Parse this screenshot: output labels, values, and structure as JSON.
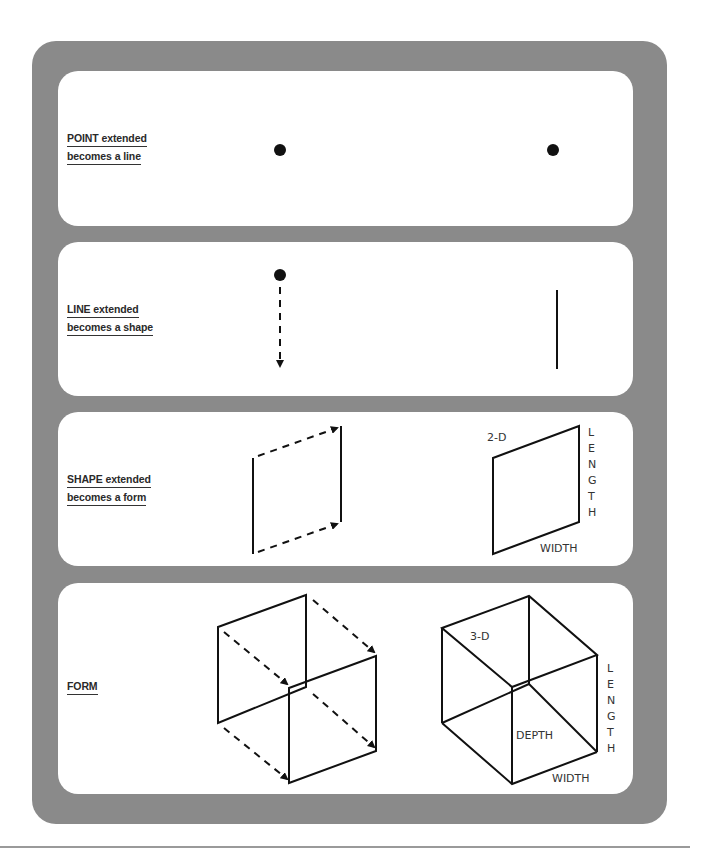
{
  "colors": {
    "frame": "#8a8a8a",
    "panel": "#ffffff",
    "ink": "#111111",
    "rule": "#9a9a9a"
  },
  "panels": [
    {
      "id": "point",
      "label_line1": "POINT extended",
      "label_line2": "becomes a line"
    },
    {
      "id": "line",
      "label_line1": "LINE extended",
      "label_line2": "becomes a shape"
    },
    {
      "id": "shape",
      "label_line1": "SHAPE extended",
      "label_line2": "becomes a form",
      "dim_label": "2-D",
      "length_label": [
        "L",
        "E",
        "N",
        "G",
        "T",
        "H"
      ],
      "width_label": "WIDTH"
    },
    {
      "id": "form",
      "label_line1": "FORM",
      "dim_label": "3-D",
      "length_label": [
        "L",
        "E",
        "N",
        "G",
        "T",
        "H"
      ],
      "width_label": "WIDTH",
      "depth_label": "DEPTH"
    }
  ]
}
